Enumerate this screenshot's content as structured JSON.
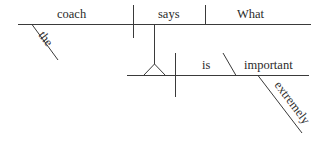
{
  "diagram": {
    "type": "reed-kellogg-sentence-diagram",
    "words": {
      "subject": "coach",
      "subject_modifier": "the",
      "verb": "says",
      "direct_object": "What",
      "clause_predicate": "is",
      "clause_complement": "important",
      "complement_modifier": "extremely"
    },
    "line_color": "#3a3a3a",
    "text_color": "#2a2a2a"
  }
}
